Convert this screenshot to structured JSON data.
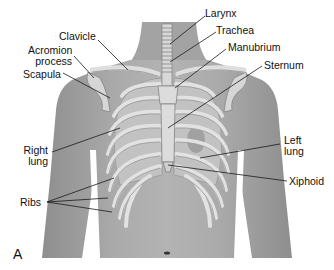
{
  "figure": {
    "panel_letter": "A",
    "labels": {
      "larynx": "Larynx",
      "trachea": "Trachea",
      "clavicle": "Clavicle",
      "acromion_1": "Acromion",
      "acromion_2": "process",
      "manubrium": "Manubrium",
      "sternum": "Sternum",
      "scapula": "Scapula",
      "right_lung_1": "Right",
      "right_lung_2": "lung",
      "left_lung_1": "Left",
      "left_lung_2": "lung",
      "xiphoid": "Xiphoid",
      "ribs": "Ribs"
    },
    "colors": {
      "skin": "#a8a8a8",
      "skin_dark": "#8c8c8c",
      "bone": "#dcdcdc",
      "lung": "#bdbdbd",
      "leader": "#222222"
    }
  }
}
